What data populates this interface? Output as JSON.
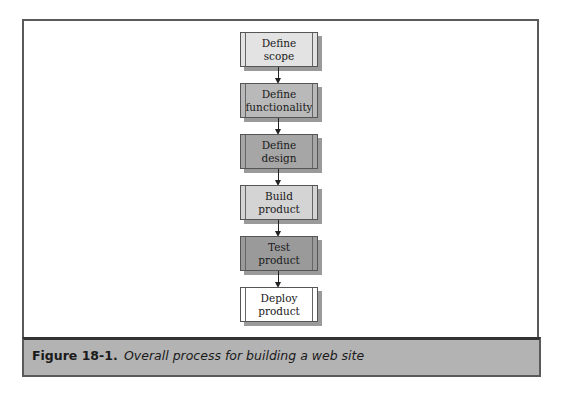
{
  "diagram": {
    "type": "flowchart",
    "direction": "top-to-bottom",
    "nodes": [
      {
        "id": "n1",
        "label": "Define scope",
        "fill": "#e3e3e3"
      },
      {
        "id": "n2",
        "label": "Define functionality",
        "fill": "#b9b9b9"
      },
      {
        "id": "n3",
        "label": "Define design",
        "fill": "#a6a6a6"
      },
      {
        "id": "n4",
        "label": "Build product",
        "fill": "#d4d4d4"
      },
      {
        "id": "n5",
        "label": "Test product",
        "fill": "#9a9a9a"
      },
      {
        "id": "n6",
        "label": "Deploy product",
        "fill": "#ffffff"
      }
    ],
    "edges": [
      {
        "from": "n1",
        "to": "n2"
      },
      {
        "from": "n2",
        "to": "n3"
      },
      {
        "from": "n3",
        "to": "n4"
      },
      {
        "from": "n4",
        "to": "n5"
      },
      {
        "from": "n5",
        "to": "n6"
      }
    ]
  },
  "caption": {
    "label": "Figure 18-1.",
    "text": "Overall process for building a web site"
  }
}
